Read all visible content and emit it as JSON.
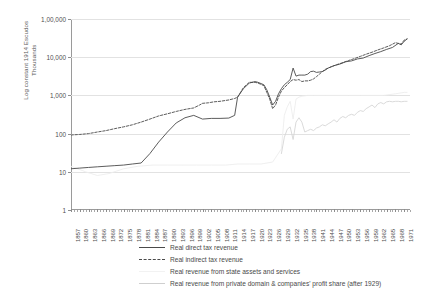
{
  "chart_data": {
    "type": "line",
    "title": "",
    "xlabel": "",
    "ylabel": "Log constant 1914 Escudos\nThousands",
    "scale": "log",
    "grid": true,
    "legend_position": "bottom",
    "ylim": [
      1,
      100000
    ],
    "yticks": [
      1,
      10,
      1000,
      10000,
      100000
    ],
    "ytick_labels": [
      "1",
      "10",
      "100",
      "1,000",
      "10,000",
      "1,00,000"
    ],
    "ytick_values": [
      1,
      10,
      100,
      1000,
      10000,
      100000
    ],
    "xlim": [
      1857,
      1973
    ],
    "xtick_labels": [
      "1857",
      "1860",
      "1863",
      "1866",
      "1869",
      "1872",
      "1875",
      "1878",
      "1881",
      "1884",
      "1887",
      "1890",
      "1893",
      "1896",
      "1899",
      "1902",
      "1905",
      "1908",
      "1911",
      "1914",
      "1917",
      "1920",
      "1923",
      "1926",
      "1929",
      "1932",
      "1935",
      "1938",
      "1941",
      "1944",
      "1947",
      "1950",
      "1953",
      "1956",
      "1959",
      "1962",
      "1965",
      "1968",
      "1971"
    ],
    "series": [
      {
        "name": "Real direct tax revenue",
        "style": "solid",
        "color": "#4a4a4a",
        "points": [
          [
            1857,
            12
          ],
          [
            1860,
            12.5
          ],
          [
            1863,
            13
          ],
          [
            1866,
            13.5
          ],
          [
            1869,
            14
          ],
          [
            1872,
            14.5
          ],
          [
            1875,
            15
          ],
          [
            1878,
            16
          ],
          [
            1881,
            17
          ],
          [
            1884,
            30
          ],
          [
            1887,
            60
          ],
          [
            1890,
            110
          ],
          [
            1893,
            190
          ],
          [
            1896,
            260
          ],
          [
            1899,
            300
          ],
          [
            1902,
            240
          ],
          [
            1905,
            250
          ],
          [
            1908,
            250
          ],
          [
            1911,
            255
          ],
          [
            1913,
            300
          ],
          [
            1914,
            900
          ],
          [
            1916,
            1500
          ],
          [
            1918,
            2100
          ],
          [
            1920,
            2300
          ],
          [
            1921,
            2200
          ],
          [
            1923,
            1900
          ],
          [
            1924,
            1400
          ],
          [
            1925,
            900
          ],
          [
            1926,
            560
          ],
          [
            1927,
            700
          ],
          [
            1928,
            1100
          ],
          [
            1929,
            1500
          ],
          [
            1930,
            1900
          ],
          [
            1931,
            2200
          ],
          [
            1932,
            2600
          ],
          [
            1933,
            5200
          ],
          [
            1934,
            3200
          ],
          [
            1935,
            3400
          ],
          [
            1936,
            3400
          ],
          [
            1937,
            3400
          ],
          [
            1938,
            3600
          ],
          [
            1939,
            4200
          ],
          [
            1940,
            4300
          ],
          [
            1941,
            4000
          ],
          [
            1942,
            4100
          ],
          [
            1943,
            4200
          ],
          [
            1944,
            4600
          ],
          [
            1945,
            5200
          ],
          [
            1947,
            6000
          ],
          [
            1949,
            6600
          ],
          [
            1951,
            7600
          ],
          [
            1953,
            8000
          ],
          [
            1955,
            9000
          ],
          [
            1957,
            9500
          ],
          [
            1959,
            11000
          ],
          [
            1961,
            12500
          ],
          [
            1963,
            14000
          ],
          [
            1965,
            16000
          ],
          [
            1967,
            18000
          ],
          [
            1969,
            23000
          ],
          [
            1970,
            21000
          ],
          [
            1971,
            26000
          ],
          [
            1972,
            30000
          ]
        ]
      },
      {
        "name": "Real indirect tax revenue",
        "style": "dashed",
        "color": "#4a4a4a",
        "points": [
          [
            1857,
            92
          ],
          [
            1860,
            95
          ],
          [
            1863,
            100
          ],
          [
            1866,
            110
          ],
          [
            1869,
            120
          ],
          [
            1872,
            135
          ],
          [
            1875,
            150
          ],
          [
            1878,
            170
          ],
          [
            1881,
            200
          ],
          [
            1884,
            240
          ],
          [
            1887,
            290
          ],
          [
            1890,
            330
          ],
          [
            1893,
            380
          ],
          [
            1896,
            430
          ],
          [
            1899,
            470
          ],
          [
            1901,
            560
          ],
          [
            1902,
            620
          ],
          [
            1904,
            640
          ],
          [
            1906,
            680
          ],
          [
            1908,
            700
          ],
          [
            1911,
            760
          ],
          [
            1913,
            830
          ],
          [
            1914,
            900
          ],
          [
            1916,
            1600
          ],
          [
            1918,
            2200
          ],
          [
            1920,
            2200
          ],
          [
            1921,
            2100
          ],
          [
            1923,
            1800
          ],
          [
            1924,
            1200
          ],
          [
            1925,
            800
          ],
          [
            1926,
            450
          ],
          [
            1927,
            560
          ],
          [
            1928,
            900
          ],
          [
            1929,
            1300
          ],
          [
            1930,
            1600
          ],
          [
            1931,
            1900
          ],
          [
            1932,
            2300
          ],
          [
            1933,
            2600
          ],
          [
            1934,
            2500
          ],
          [
            1935,
            2600
          ],
          [
            1936,
            2300
          ],
          [
            1937,
            2400
          ],
          [
            1938,
            2400
          ],
          [
            1939,
            2500
          ],
          [
            1940,
            2700
          ],
          [
            1941,
            3100
          ],
          [
            1942,
            3600
          ],
          [
            1943,
            4200
          ],
          [
            1944,
            4800
          ],
          [
            1946,
            5600
          ],
          [
            1948,
            6400
          ],
          [
            1950,
            7200
          ],
          [
            1952,
            8200
          ],
          [
            1954,
            9200
          ],
          [
            1956,
            10500
          ],
          [
            1958,
            12000
          ],
          [
            1960,
            13500
          ],
          [
            1962,
            15500
          ],
          [
            1964,
            17500
          ],
          [
            1966,
            20000
          ],
          [
            1968,
            24000
          ],
          [
            1970,
            22000
          ],
          [
            1971,
            28000
          ],
          [
            1972,
            30000
          ]
        ]
      },
      {
        "name": "Real revenue from state assets and services",
        "style": "solid",
        "color": "#ededed",
        "points": [
          [
            1857,
            14
          ],
          [
            1862,
            10
          ],
          [
            1866,
            8
          ],
          [
            1870,
            9
          ],
          [
            1875,
            12
          ],
          [
            1880,
            14
          ],
          [
            1885,
            15
          ],
          [
            1890,
            15
          ],
          [
            1895,
            15
          ],
          [
            1900,
            15
          ],
          [
            1905,
            15
          ],
          [
            1910,
            15
          ],
          [
            1914,
            16
          ],
          [
            1918,
            16
          ],
          [
            1922,
            16
          ],
          [
            1926,
            18
          ],
          [
            1929,
            40
          ],
          [
            1930,
            300
          ],
          [
            1931,
            500
          ],
          [
            1932,
            700
          ],
          [
            1933,
            240
          ],
          [
            1934,
            800
          ],
          [
            1935,
            900
          ],
          [
            1936,
            950
          ],
          [
            1938,
            1000
          ],
          [
            1940,
            1000
          ],
          [
            1944,
            1000
          ],
          [
            1948,
            1000
          ],
          [
            1952,
            1000
          ],
          [
            1956,
            1000
          ],
          [
            1960,
            1000
          ],
          [
            1964,
            1000
          ],
          [
            1968,
            1100
          ],
          [
            1971,
            1200
          ],
          [
            1972,
            1200
          ]
        ]
      },
      {
        "name": "Real revenue from private domain & companies' profit share (after 1929)",
        "style": "solid",
        "color": "#d6d6d6",
        "points": [
          [
            1929,
            30
          ],
          [
            1930,
            80
          ],
          [
            1931,
            130
          ],
          [
            1932,
            150
          ],
          [
            1933,
            70
          ],
          [
            1934,
            200
          ],
          [
            1935,
            260
          ],
          [
            1936,
            200
          ],
          [
            1937,
            110
          ],
          [
            1938,
            120
          ],
          [
            1939,
            130
          ],
          [
            1940,
            120
          ],
          [
            1941,
            140
          ],
          [
            1942,
            150
          ],
          [
            1943,
            170
          ],
          [
            1944,
            160
          ],
          [
            1945,
            180
          ],
          [
            1946,
            200
          ],
          [
            1947,
            230
          ],
          [
            1948,
            200
          ],
          [
            1949,
            250
          ],
          [
            1950,
            280
          ],
          [
            1951,
            260
          ],
          [
            1952,
            300
          ],
          [
            1953,
            320
          ],
          [
            1954,
            300
          ],
          [
            1955,
            360
          ],
          [
            1956,
            400
          ],
          [
            1957,
            380
          ],
          [
            1958,
            450
          ],
          [
            1959,
            500
          ],
          [
            1960,
            560
          ],
          [
            1961,
            480
          ],
          [
            1962,
            600
          ],
          [
            1963,
            650
          ],
          [
            1964,
            600
          ],
          [
            1965,
            680
          ],
          [
            1966,
            700
          ],
          [
            1967,
            680
          ],
          [
            1968,
            700
          ],
          [
            1969,
            700
          ],
          [
            1970,
            680
          ],
          [
            1971,
            700
          ],
          [
            1972,
            700
          ]
        ]
      }
    ]
  },
  "legend": {
    "items": [
      {
        "label": "Real direct tax revenue",
        "style": "sw-solid-dark"
      },
      {
        "label": "Real indirect tax revenue",
        "style": "sw-dashed-dark"
      },
      {
        "label": "Real revenue from state assets and services",
        "style": "sw-solid-light1"
      },
      {
        "label": "Real revenue from private domain & companies' profit share (after 1929)",
        "style": "sw-solid-light2"
      }
    ]
  }
}
